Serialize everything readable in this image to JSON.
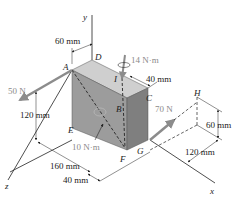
{
  "figure": {
    "axes": {
      "x": "x",
      "y": "y",
      "z": "z"
    },
    "points": {
      "A": "A",
      "B": "B",
      "C": "C",
      "D": "D",
      "E": "E",
      "F": "F",
      "G": "G",
      "H": "H",
      "I": "I"
    },
    "dimensions": {
      "d_60_top": "60 mm",
      "d_40_right": "40 mm",
      "d_120_left": "120 mm",
      "d_160_bottom": "160 mm",
      "d_40_bottom": "40 mm",
      "d_60_right": "60 mm",
      "d_120_right": "120 mm"
    },
    "loads": {
      "force_50": "50 N",
      "force_70": "70 N",
      "couple_14": "14 N·m",
      "couple_10": "10 N·m"
    },
    "colors": {
      "block_top": "#c9c9c9",
      "block_front": "#9a9a9a",
      "block_side": "#7d7d7d",
      "arrow": "#8c8c8c",
      "line": "#222222"
    }
  }
}
